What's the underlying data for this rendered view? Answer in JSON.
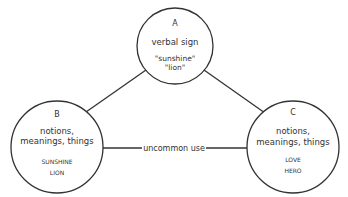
{
  "nodes": {
    "a": {
      "letter": "A",
      "title": "verbal sign",
      "items": [
        "\"sunshine\"",
        "\"lion\""
      ]
    },
    "b": {
      "letter": "B",
      "title_lines": [
        "notions,",
        "meanings, things"
      ],
      "items": [
        "SUNSHINE",
        "LION"
      ]
    },
    "c": {
      "letter": "C",
      "title_lines": [
        "notions,",
        "meanings, things"
      ],
      "items": [
        "LOVE",
        "HERO"
      ]
    }
  },
  "edges": {
    "bc_label": "uncommon use"
  },
  "colors": {
    "stroke": "#333333",
    "text": "#333333",
    "background": "#ffffff"
  }
}
